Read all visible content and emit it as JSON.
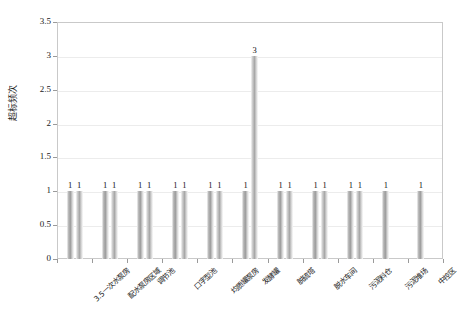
{
  "chart_data": {
    "type": "bar",
    "title": "",
    "xlabel": "",
    "ylabel": "超标频次",
    "ylim": [
      0,
      3.5
    ],
    "ytick_labels": [
      "0",
      "0.5",
      "1",
      "1.5",
      "2",
      "2.5",
      "3",
      "3.5"
    ],
    "ytick_values": [
      0,
      0.5,
      1,
      1.5,
      2,
      2.5,
      3,
      3.5
    ],
    "grid": true,
    "legend": "none",
    "categories": [
      "3.5一次水泵房",
      "配水泵房区域",
      "调节池",
      "口字型池",
      "均质罐泵房",
      "发酵罐",
      "脱硫塔",
      "脱水车间",
      "污泥料仓",
      "污泥堆场",
      "中控区"
    ],
    "series": [
      {
        "name": "系列1",
        "values": [
          1,
          1,
          1,
          1,
          1,
          1,
          1,
          1,
          1,
          1,
          1
        ],
        "labels": [
          "1",
          "1",
          "1",
          "1",
          "1",
          "1",
          "1",
          "1",
          "1",
          "1",
          "1"
        ]
      },
      {
        "name": "系列2",
        "values": [
          1,
          1,
          1,
          1,
          1,
          3,
          1,
          1,
          1,
          null,
          null
        ],
        "labels": [
          "1",
          "1",
          "1",
          "1",
          "1",
          "3",
          "1",
          "1",
          "1",
          "",
          ""
        ]
      }
    ]
  },
  "colors": {
    "series1": "#9c9c9c",
    "series2": "#a8a8a8",
    "grid": "#ececec",
    "frame": "#c9c9c9",
    "text": "#1a1a1a"
  }
}
